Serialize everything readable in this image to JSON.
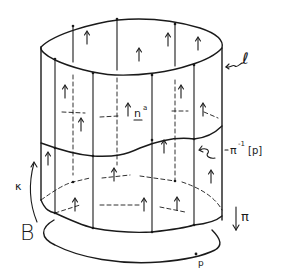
{
  "diagram": {
    "labels": {
      "total_space": "ℓ",
      "normal_vector": "n",
      "normal_vector_superscript": "a",
      "fibre": "π",
      "fibre_superscript": "-1",
      "fibre_argument": "[p]",
      "curve_label": "κ",
      "base": "B",
      "projection": "π",
      "point": "p"
    },
    "colors": {
      "ink": "#1a1a1a",
      "background": "#ffffff"
    }
  }
}
